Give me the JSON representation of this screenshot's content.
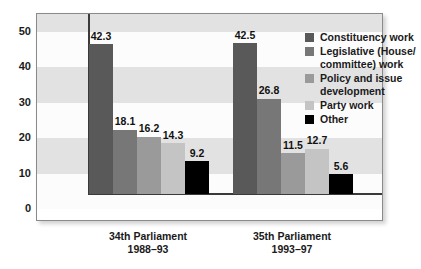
{
  "chart_data": {
    "type": "bar",
    "title": "",
    "subtitle": "",
    "xlabel": "",
    "ylabel": "",
    "ylim": [
      0,
      55
    ],
    "yticks": [
      "0",
      "10",
      "20",
      "30",
      "40",
      "50"
    ],
    "ytick_values": [
      0,
      10,
      20,
      30,
      40,
      50
    ],
    "grid": false,
    "banded_background": true,
    "legend_position": "top-right",
    "categories": [
      "34th Parliament\n1988–93",
      "35th Parliament\n1993–97"
    ],
    "group_labels": [
      {
        "line1": "34th Parliament",
        "line2": "1988–93"
      },
      {
        "line1": "35th Parliament",
        "line2": "1993–97"
      }
    ],
    "series": [
      {
        "name": "Constituency work",
        "color": "#595959",
        "values": [
          42.3,
          42.5
        ],
        "labels": [
          "42.3",
          "42.5"
        ]
      },
      {
        "name": "Legislative (House/committee) work",
        "name_line1": "Legislative (House/",
        "name_line2": "committee) work",
        "color": "#777777",
        "values": [
          18.1,
          26.8
        ],
        "labels": [
          "18.1",
          "26.8"
        ]
      },
      {
        "name": "Policy and issue development",
        "name_line1": "Policy and issue",
        "name_line2": "development",
        "color": "#9a9a9a",
        "values": [
          16.2,
          11.5
        ],
        "labels": [
          "16.2",
          "11.5"
        ]
      },
      {
        "name": "Party work",
        "color": "#c4c4c4",
        "values": [
          14.3,
          12.7
        ],
        "labels": [
          "14.3",
          "12.7"
        ]
      },
      {
        "name": "Other",
        "color": "#000000",
        "values": [
          9.2,
          5.6
        ],
        "labels": [
          "9.2",
          "5.6"
        ]
      }
    ]
  },
  "legend": {
    "items": [
      {
        "label": "Constituency work",
        "label2": "",
        "color": "#595959"
      },
      {
        "label": "Legislative (House/",
        "label2": "committee) work",
        "color": "#777777"
      },
      {
        "label": "Policy and issue",
        "label2": "development",
        "color": "#9a9a9a"
      },
      {
        "label": "Party work",
        "label2": "",
        "color": "#c4c4c4"
      },
      {
        "label": "Other",
        "label2": "",
        "color": "#000000"
      }
    ]
  },
  "style": {
    "band_gray": "#e2e2e2",
    "band_white": "#fcfcfc",
    "frame_border": "#8a8a8a",
    "axis_color": "#3a3a3a",
    "text_color": "#1a1a1a"
  }
}
